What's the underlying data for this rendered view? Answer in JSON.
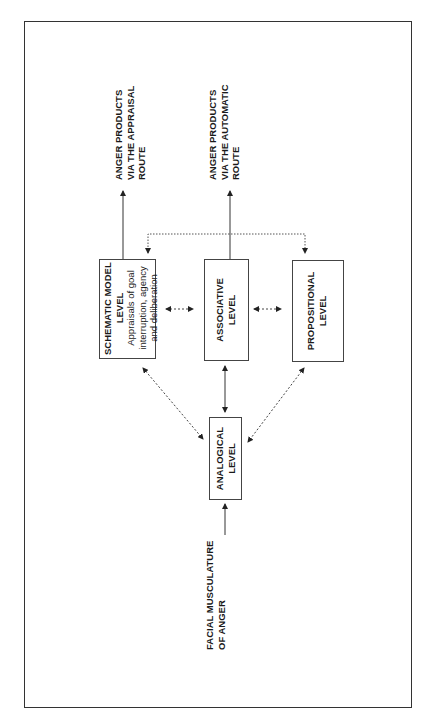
{
  "diagram": {
    "nodes": {
      "schematic": {
        "title_line1": "SCHEMATIC MODEL",
        "title_line2": "LEVEL",
        "desc_line1": "Appraisals of goal",
        "desc_line2": "interruption, agency",
        "desc_line3": "and deliberation"
      },
      "associative": {
        "line1": "ASSOCIATIVE",
        "line2": "LEVEL"
      },
      "propositional": {
        "line1": "PROPOSITIONAL",
        "line2": "LEVEL"
      },
      "analogical": {
        "line1": "ANALOGICAL",
        "line2": "LEVEL"
      }
    },
    "inputs": {
      "facial": {
        "line1": "FACIAL MUSCULATURE",
        "line2": "OF ANGER"
      }
    },
    "outputs": {
      "appraisal": {
        "line1": "ANGER PRODUCTS",
        "line2": "VIA THE APPRAISAL",
        "line3": "ROUTE"
      },
      "automatic": {
        "line1": "ANGER PRODUCTS",
        "line2": "VIA THE AUTOMATIC",
        "line3": "ROUTE"
      }
    },
    "edges": [
      {
        "from": "facial",
        "to": "analogical",
        "style": "solid",
        "direction": "one-way"
      },
      {
        "from": "analogical",
        "to": "associative",
        "style": "solid",
        "direction": "two-way"
      },
      {
        "from": "analogical",
        "to": "schematic",
        "style": "dotted",
        "direction": "two-way"
      },
      {
        "from": "analogical",
        "to": "propositional",
        "style": "dotted",
        "direction": "two-way"
      },
      {
        "from": "schematic",
        "to": "associative",
        "style": "dotted",
        "direction": "two-way"
      },
      {
        "from": "associative",
        "to": "propositional",
        "style": "dotted",
        "direction": "two-way"
      },
      {
        "from": "associative",
        "to": "schematic+propositional",
        "style": "dotted",
        "direction": "branch"
      },
      {
        "from": "schematic",
        "to": "appraisal",
        "style": "solid",
        "direction": "one-way"
      },
      {
        "from": "associative",
        "to": "automatic",
        "style": "solid",
        "direction": "one-way"
      }
    ],
    "colors": {
      "line": "#333333",
      "text": "#1a1a1a",
      "background": "#ffffff"
    }
  }
}
